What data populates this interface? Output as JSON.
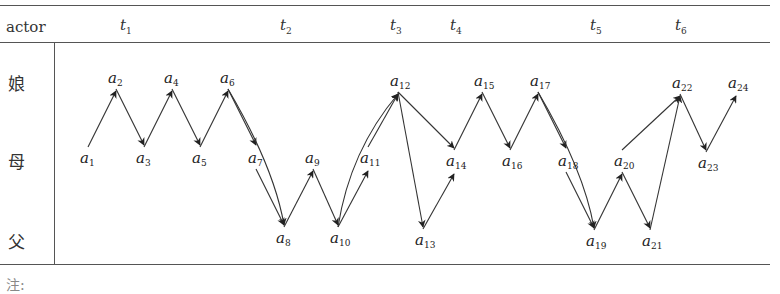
{
  "header": {
    "actor_label": "actor",
    "time_labels": [
      {
        "base": "t",
        "sub": "1",
        "x": 120
      },
      {
        "base": "t",
        "sub": "2",
        "x": 280
      },
      {
        "base": "t",
        "sub": "3",
        "x": 390
      },
      {
        "base": "t",
        "sub": "4",
        "x": 450
      },
      {
        "base": "t",
        "sub": "5",
        "x": 590
      },
      {
        "base": "t",
        "sub": "6",
        "x": 675
      }
    ]
  },
  "actors": [
    {
      "id": "niang",
      "label": "娘",
      "y": 80
    },
    {
      "id": "mu",
      "label": "母",
      "y": 158
    },
    {
      "id": "fu",
      "label": "父",
      "y": 238
    }
  ],
  "nodes": [
    {
      "id": "a1",
      "label": "a",
      "sub": "1",
      "x": 80,
      "y": 163
    },
    {
      "id": "a2",
      "label": "a",
      "sub": "2",
      "x": 108,
      "y": 83
    },
    {
      "id": "a3",
      "label": "a",
      "sub": "3",
      "x": 136,
      "y": 163
    },
    {
      "id": "a4",
      "label": "a",
      "sub": "4",
      "x": 164,
      "y": 83
    },
    {
      "id": "a5",
      "label": "a",
      "sub": "5",
      "x": 192,
      "y": 163
    },
    {
      "id": "a6",
      "label": "a",
      "sub": "6",
      "x": 220,
      "y": 83
    },
    {
      "id": "a7",
      "label": "a",
      "sub": "7",
      "x": 248,
      "y": 163
    },
    {
      "id": "a8",
      "label": "a",
      "sub": "8",
      "x": 276,
      "y": 243
    },
    {
      "id": "a9",
      "label": "a",
      "sub": "9",
      "x": 305,
      "y": 163
    },
    {
      "id": "a10",
      "label": "a",
      "sub": "10",
      "x": 330,
      "y": 243
    },
    {
      "id": "a11",
      "label": "a",
      "sub": "11",
      "x": 360,
      "y": 163
    },
    {
      "id": "a12",
      "label": "a",
      "sub": "12",
      "x": 390,
      "y": 86
    },
    {
      "id": "a13",
      "label": "a",
      "sub": "13",
      "x": 415,
      "y": 245
    },
    {
      "id": "a14",
      "label": "a",
      "sub": "14",
      "x": 446,
      "y": 166
    },
    {
      "id": "a15",
      "label": "a",
      "sub": "15",
      "x": 474,
      "y": 86
    },
    {
      "id": "a16",
      "label": "a",
      "sub": "16",
      "x": 502,
      "y": 166
    },
    {
      "id": "a17",
      "label": "a",
      "sub": "17",
      "x": 530,
      "y": 86
    },
    {
      "id": "a18",
      "label": "a",
      "sub": "18",
      "x": 558,
      "y": 166
    },
    {
      "id": "a19",
      "label": "a",
      "sub": "19",
      "x": 586,
      "y": 246
    },
    {
      "id": "a20",
      "label": "a",
      "sub": "20",
      "x": 614,
      "y": 166
    },
    {
      "id": "a21",
      "label": "a",
      "sub": "21",
      "x": 642,
      "y": 246
    },
    {
      "id": "a22",
      "label": "a",
      "sub": "22",
      "x": 672,
      "y": 88
    },
    {
      "id": "a23",
      "label": "a",
      "sub": "23",
      "x": 698,
      "y": 168
    },
    {
      "id": "a24",
      "label": "a",
      "sub": "24",
      "x": 728,
      "y": 88
    }
  ],
  "edges": [
    {
      "from": "a1",
      "to": "a2"
    },
    {
      "from": "a2",
      "to": "a3"
    },
    {
      "from": "a3",
      "to": "a4"
    },
    {
      "from": "a4",
      "to": "a5"
    },
    {
      "from": "a5",
      "to": "a6"
    },
    {
      "from": "a6",
      "to": "a7"
    },
    {
      "from": "a6",
      "to": "a8",
      "curved": true
    },
    {
      "from": "a7",
      "to": "a8"
    },
    {
      "from": "a8",
      "to": "a9"
    },
    {
      "from": "a9",
      "to": "a10"
    },
    {
      "from": "a10",
      "to": "a11"
    },
    {
      "from": "a10",
      "to": "a12",
      "curved": true
    },
    {
      "from": "a11",
      "to": "a12"
    },
    {
      "from": "a12",
      "to": "a13"
    },
    {
      "from": "a12",
      "to": "a14"
    },
    {
      "from": "a13",
      "to": "a14"
    },
    {
      "from": "a14",
      "to": "a15"
    },
    {
      "from": "a15",
      "to": "a16"
    },
    {
      "from": "a16",
      "to": "a17"
    },
    {
      "from": "a17",
      "to": "a18"
    },
    {
      "from": "a17",
      "to": "a19",
      "curved": true
    },
    {
      "from": "a18",
      "to": "a19"
    },
    {
      "from": "a19",
      "to": "a20"
    },
    {
      "from": "a20",
      "to": "a21"
    },
    {
      "from": "a20",
      "to": "a22"
    },
    {
      "from": "a21",
      "to": "a22"
    },
    {
      "from": "a22",
      "to": "a23"
    },
    {
      "from": "a23",
      "to": "a24"
    }
  ],
  "footer": {
    "text": "注:"
  },
  "colors": {
    "line": "#333333",
    "text": "#222222",
    "rule": "#555555"
  }
}
